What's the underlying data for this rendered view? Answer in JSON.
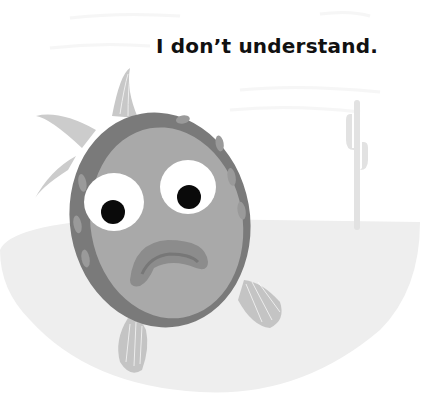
{
  "page": {
    "caption": "I don’t understand.",
    "illustration": {
      "subject": "worried-fish",
      "background": "desert-scene-with-cactus",
      "colors": {
        "ground": "#eeeeee",
        "body_rim": "#7a7a7a",
        "body_face": "#a9a9a9",
        "rim_spots": "#9a9a9a",
        "fin": "#c8c8c8",
        "eye_white": "#ffffff",
        "pupil": "#0a0a0a",
        "mouth": "#8c8c8c",
        "mouth_inner": "#777777",
        "text": "#111111"
      }
    }
  }
}
